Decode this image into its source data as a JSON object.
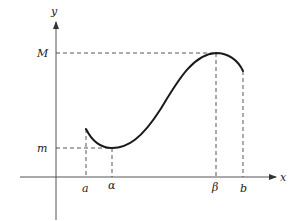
{
  "diagram": {
    "type": "function-extrema-plot",
    "axes": {
      "x_label": "x",
      "y_label": "y"
    },
    "y_levels": {
      "max_label": "M",
      "min_label": "m"
    },
    "x_marks": {
      "a": "a",
      "alpha": "α",
      "beta": "β",
      "b": "b"
    },
    "colors": {
      "axis": "#555555",
      "curve": "#1a1a1a",
      "dashed": "#444444",
      "background": "#ffffff"
    }
  }
}
